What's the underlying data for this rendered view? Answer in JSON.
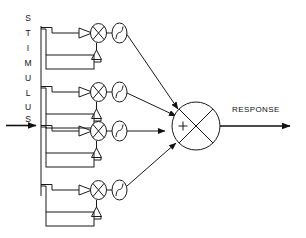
{
  "figure": {
    "background_color": "#ffffff",
    "line_color": "#1a1a1a",
    "width": 306,
    "height": 238
  },
  "labels": {
    "stimulus": {
      "text": "STIMULUS",
      "letters": [
        "S",
        "T",
        "I",
        "M",
        "U",
        "L",
        "U",
        "S"
      ],
      "orientation": "vertical",
      "x": 28,
      "letter_y": [
        18,
        33,
        48,
        63,
        78,
        93,
        108,
        120
      ]
    },
    "response": {
      "text": "RESPONSE",
      "x": 232,
      "y": 112
    },
    "caption": {
      "text": "Figure 1. Parallel channel model of stimulus processing",
      "visible": false
    }
  },
  "input": {
    "arrow_label": "stimulus-input-arrow",
    "y": 125,
    "x_start": 6,
    "x_end": 40
  },
  "bus": {
    "name": "stimulus-bus",
    "x": 41,
    "y_top": 26,
    "y_bottom": 196
  },
  "channels": [
    {
      "index": 1,
      "name": "channel-1",
      "y": 33,
      "feedback_box_y": 55,
      "multiplier_cx": 98,
      "sigmoid_cx": 119,
      "has_feedback": true,
      "gain_triangle": "amplifier"
    },
    {
      "index": 2,
      "name": "channel-2",
      "y": 92,
      "feedback_box_y": 114,
      "multiplier_cx": 98,
      "sigmoid_cx": 119,
      "has_feedback": true,
      "gain_triangle": "amplifier"
    },
    {
      "index": 3,
      "name": "channel-3",
      "y": 131,
      "feedback_box_y": 153,
      "multiplier_cx": 98,
      "sigmoid_cx": 119,
      "has_feedback": true,
      "gain_triangle": "amplifier"
    },
    {
      "index": 4,
      "name": "channel-4",
      "y": 190,
      "feedback_box_y": 212,
      "multiplier_cx": 98,
      "sigmoid_cx": 119,
      "has_feedback": true,
      "gain_triangle": "amplifier"
    }
  ],
  "summing_junction": {
    "name": "summing-junction",
    "symbol": "+",
    "cx": 196,
    "cy": 126,
    "r": 24,
    "cross": true
  },
  "output": {
    "name": "response-output-arrow",
    "y": 126,
    "x_start": 220,
    "x_end": 296
  },
  "components": {
    "multiplier": "circle-with-x",
    "sigmoid": "ellipse-with-s-curve",
    "amplifier": "triangle",
    "feedback": "rectangle-block"
  }
}
